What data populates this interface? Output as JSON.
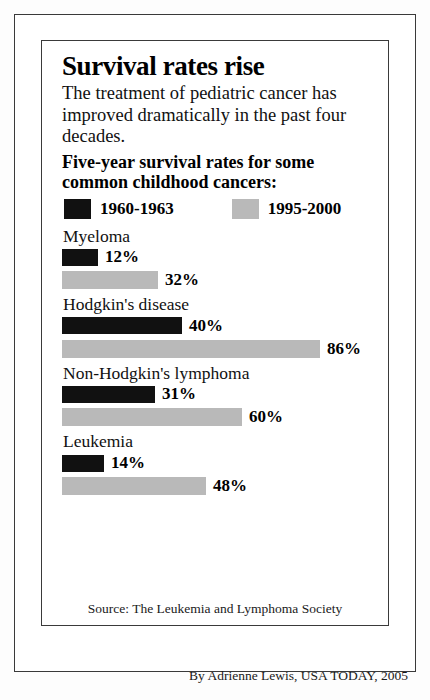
{
  "headline": "Survival rates rise",
  "deck": "The treatment of pediatric cancer has improved dramatically in the past four decades.",
  "kicker": "Five-year survival rates for some common childhood cancers:",
  "legend": {
    "old": {
      "label": "1960-1963",
      "color": "#111111",
      "swatch_name": "legend-swatch-black"
    },
    "new": {
      "label": "1995-2000",
      "color": "#b9b9b9",
      "swatch_name": "legend-swatch-gray"
    }
  },
  "groups": [
    {
      "label": "Myeloma",
      "old_value": "12%",
      "new_value": "32%"
    },
    {
      "label": "Hodgkin's disease",
      "old_value": "40%",
      "new_value": "86%"
    },
    {
      "label": "Non-Hodgkin's lymphoma",
      "old_value": "31%",
      "new_value": "60%"
    },
    {
      "label": "Leukemia",
      "old_value": "14%",
      "new_value": "48%"
    }
  ],
  "source": "Source: The Leukemia and Lymphoma Society",
  "credit": "By Adrienne Lewis, USA TODAY, 2005",
  "chart_data": {
    "type": "bar",
    "title": "Survival rates rise",
    "subtitle": "Five-year survival rates for some common childhood cancers:",
    "orientation": "horizontal",
    "categories": [
      "Myeloma",
      "Hodgkin's disease",
      "Non-Hodgkin's lymphoma",
      "Leukemia"
    ],
    "series": [
      {
        "name": "1960-1963",
        "color": "#111111",
        "values": [
          12,
          40,
          31,
          14
        ]
      },
      {
        "name": "1995-2000",
        "color": "#b9b9b9",
        "values": [
          32,
          86,
          60,
          48
        ]
      }
    ],
    "value_suffix": "%",
    "xlabel": "",
    "ylabel": "",
    "xlim": [
      0,
      86
    ],
    "grid": false,
    "legend_position": "top",
    "px_per_percent": 3.0,
    "annotations": [
      "Source: The Leukemia and Lymphoma Society",
      "By Adrienne Lewis, USA TODAY, 2005"
    ]
  }
}
